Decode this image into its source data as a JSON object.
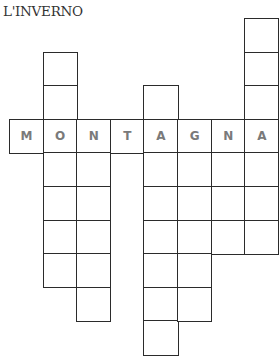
{
  "puzzle": {
    "title": "L'INVERNO",
    "type": "crossword",
    "given_word": "MONTAGNA",
    "grid": {
      "origin_x": 9,
      "origin_y": 18,
      "cell_size": 33.6,
      "columns": [
        {
          "col": 0,
          "rows": [
            3
          ]
        },
        {
          "col": 1,
          "rows": [
            1,
            2,
            3,
            4,
            5,
            6,
            7
          ]
        },
        {
          "col": 2,
          "rows": [
            3,
            4,
            5,
            6,
            7,
            8
          ]
        },
        {
          "col": 3,
          "rows": [
            3
          ]
        },
        {
          "col": 4,
          "rows": [
            2,
            3,
            4,
            5,
            6,
            7,
            8,
            9
          ]
        },
        {
          "col": 5,
          "rows": [
            3,
            4,
            5,
            6,
            7,
            8
          ]
        },
        {
          "col": 6,
          "rows": [
            3,
            4,
            5,
            6
          ]
        },
        {
          "col": 7,
          "rows": [
            0,
            1,
            2,
            3,
            4,
            5,
            6
          ]
        }
      ],
      "letters": [
        {
          "col": 0,
          "row": 3,
          "letter": "M"
        },
        {
          "col": 1,
          "row": 3,
          "letter": "O"
        },
        {
          "col": 2,
          "row": 3,
          "letter": "N"
        },
        {
          "col": 3,
          "row": 3,
          "letter": "T"
        },
        {
          "col": 4,
          "row": 3,
          "letter": "A"
        },
        {
          "col": 5,
          "row": 3,
          "letter": "G"
        },
        {
          "col": 6,
          "row": 3,
          "letter": "N"
        },
        {
          "col": 7,
          "row": 3,
          "letter": "A"
        }
      ]
    }
  }
}
